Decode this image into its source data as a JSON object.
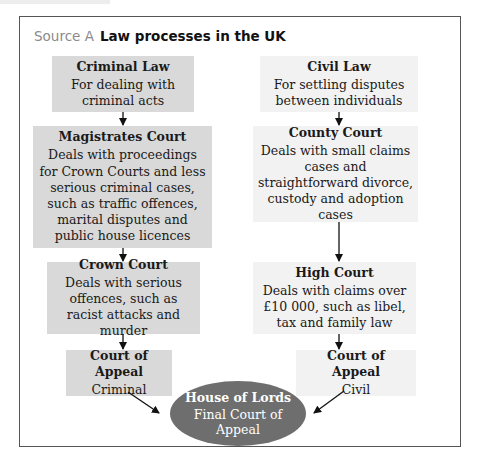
{
  "title": {
    "source_label": "Source A",
    "text": "Law processes in the UK"
  },
  "criminal": {
    "law": {
      "heading": "Criminal Law",
      "body": "For dealing with criminal acts"
    },
    "magistrates": {
      "heading": "Magistrates Court",
      "body": "Deals with proceedings for Crown Courts and less serious criminal cases, such as traffic offences, marital disputes and public house licences"
    },
    "crown": {
      "heading": "Crown Court",
      "body": "Deals with serious offences, such as racist attacks and murder"
    },
    "appeal": {
      "heading": "Court of Appeal",
      "body": "Criminal"
    }
  },
  "civil": {
    "law": {
      "heading": "Civil Law",
      "body": "For settling disputes between individuals"
    },
    "county": {
      "heading": "County Court",
      "body": "Deals with small claims cases and straightforward divorce, custody and adoption cases"
    },
    "high": {
      "heading": "High Court",
      "body": "Deals with claims over £10 000, such as libel, tax and family law"
    },
    "appeal": {
      "heading": "Court of Appeal",
      "body": "Civil"
    }
  },
  "final": {
    "heading": "House of Lords",
    "body": "Final Court of Appeal"
  },
  "colors": {
    "criminal_fill": "#d9d9d9",
    "civil_fill": "#f2f2f2",
    "final_fill": "#6e6e6e",
    "frame": "#555555"
  }
}
